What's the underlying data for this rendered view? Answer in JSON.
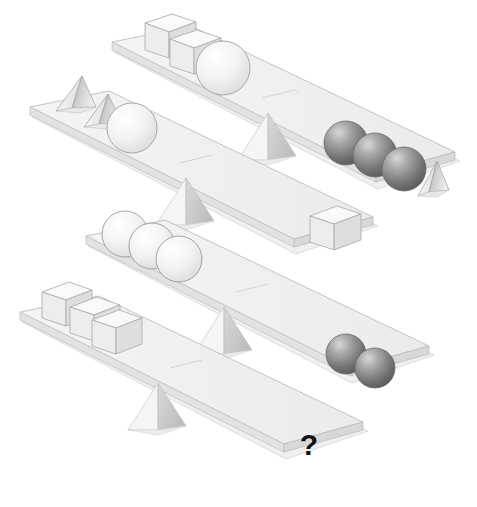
{
  "puzzle": {
    "title": "Balance scale weight puzzle",
    "type": "balance-scales",
    "unknown_marker": "?",
    "scale_count": 4,
    "shapes_legend": [
      {
        "key": "white-cube",
        "label": "white cube",
        "color": "#f2f2f2"
      },
      {
        "key": "white-sphere",
        "label": "white sphere",
        "color": "#f4f4f4"
      },
      {
        "key": "dark-sphere",
        "label": "dark gray sphere",
        "color": "#6e6e6e"
      },
      {
        "key": "pyramid",
        "label": "pyramid",
        "color": "#d9d9d9"
      }
    ],
    "scales": [
      {
        "id": "scale-1",
        "tilt": "down-right",
        "left": {
          "items": [
            {
              "shape": "white-cube",
              "count": 2
            },
            {
              "shape": "white-sphere",
              "count": 1
            }
          ],
          "summary": "2 white cubes + 1 white sphere"
        },
        "right": {
          "items": [
            {
              "shape": "dark-sphere",
              "count": 3
            },
            {
              "shape": "pyramid",
              "count": 1
            }
          ],
          "summary": "3 dark spheres + 1 pyramid"
        }
      },
      {
        "id": "scale-2",
        "tilt": "down-right",
        "left": {
          "items": [
            {
              "shape": "pyramid",
              "count": 2
            },
            {
              "shape": "white-sphere",
              "count": 1
            }
          ],
          "summary": "2 pyramids + 1 white sphere"
        },
        "right": {
          "items": [
            {
              "shape": "white-cube",
              "count": 1
            }
          ],
          "summary": "1 white cube"
        }
      },
      {
        "id": "scale-3",
        "tilt": "down-right",
        "left": {
          "items": [
            {
              "shape": "white-sphere",
              "count": 3
            }
          ],
          "summary": "3 white spheres"
        },
        "right": {
          "items": [
            {
              "shape": "dark-sphere",
              "count": 2
            }
          ],
          "summary": "2 dark spheres"
        }
      },
      {
        "id": "scale-4",
        "tilt": "down-right",
        "left": {
          "items": [
            {
              "shape": "white-cube",
              "count": 3
            }
          ],
          "summary": "3 white cubes"
        },
        "right": {
          "items": [],
          "summary": "?",
          "label": "?"
        }
      }
    ]
  },
  "colors": {
    "background": "#ffffff",
    "beam_top": "#f0f0f0",
    "beam_side": "#dcdcdc",
    "beam_front": "#e4e4e4",
    "fulcrum_light": "#f6f6f6",
    "fulcrum_dark": "#c6c6c6",
    "cube_top": "#f7f7f7",
    "cube_left": "#ededed",
    "cube_right": "#dedede",
    "sphere_white": "#f6f6f6",
    "sphere_dark_light": "#c9c9c9",
    "sphere_dark_deep": "#5f5f5f",
    "outline": "#9a9a9a",
    "question_mark": "#111111"
  }
}
